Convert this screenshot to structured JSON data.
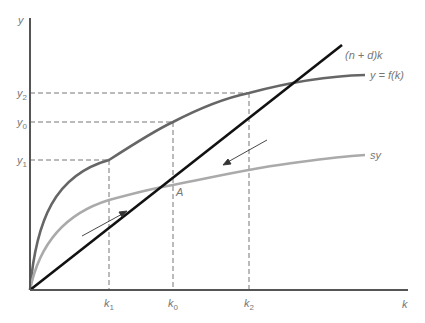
{
  "diagram": {
    "axes": {
      "x_label": "k",
      "y_label": "y"
    },
    "curves": {
      "production": {
        "label": "y = f(k)",
        "color": "#666666"
      },
      "saving": {
        "label": "sy",
        "color": "#aaaaaa"
      },
      "depreciation": {
        "label": "(n + d)k",
        "color": "#111111"
      }
    },
    "points": {
      "steady_state": {
        "label": "A"
      }
    },
    "x_ticks": [
      {
        "base": "k",
        "sub": "1"
      },
      {
        "base": "k",
        "sub": "0"
      },
      {
        "base": "k",
        "sub": "2"
      }
    ],
    "y_ticks": [
      {
        "base": "y",
        "sub": "2"
      },
      {
        "base": "y",
        "sub": "0"
      },
      {
        "base": "y",
        "sub": "1"
      }
    ],
    "colors": {
      "axis": "#555555",
      "guide": "#666666",
      "arrow": "#333333"
    }
  }
}
